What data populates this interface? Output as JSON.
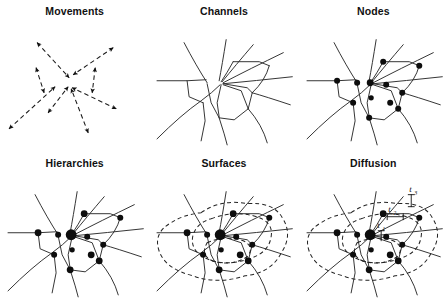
{
  "figure": {
    "layout": {
      "rows": 2,
      "columns": 3
    },
    "background_color": "#ffffff",
    "ink_color": "#1a1a1a"
  },
  "panels": [
    {
      "id": "movements",
      "title": "Movements",
      "row": 1,
      "column": 1,
      "content_type": "dashed double-headed arrows radiating from a common center",
      "arrow_count": 8,
      "line_style": "dashed",
      "arrowheads": "both ends"
    },
    {
      "id": "channels",
      "title": "Channels",
      "row": 1,
      "column": 2,
      "content_type": "network of solid lines / channel segments forming a planar graph",
      "line_style": "solid",
      "nodes_shown": false
    },
    {
      "id": "nodes",
      "title": "Nodes",
      "row": 1,
      "column": 3,
      "content_type": "same channel network with filled circular nodes at intersections",
      "line_style": "solid",
      "nodes_shown": true,
      "node_count": 12,
      "node_style": "uniform filled black dots"
    },
    {
      "id": "hierarchies",
      "title": "Hierarchies",
      "row": 2,
      "column": 1,
      "content_type": "node network with graduated node sizes indicating hierarchy",
      "line_style": "solid",
      "nodes_shown": true,
      "node_count": 12,
      "node_style": "graduated sizes, one enlarged central node"
    },
    {
      "id": "surfaces",
      "title": "Surfaces",
      "row": 2,
      "column": 2,
      "content_type": "node network overlaid with nested dashed closed contours (surfaces)",
      "line_style": "solid network plus dashed contours",
      "nodes_shown": true,
      "node_count": 12,
      "contour_count": 3
    },
    {
      "id": "diffusion",
      "title": "Diffusion",
      "row": 2,
      "column": 3,
      "content_type": "node network with dashed contours and labelled time steps of spread",
      "line_style": "solid network plus dashed contours",
      "nodes_shown": true,
      "node_count": 12,
      "contour_count": 3,
      "time_labels": [
        {
          "label": "t",
          "subscript": "1"
        },
        {
          "label": "t",
          "subscript": "2"
        },
        {
          "label": "t",
          "subscript": "3"
        }
      ]
    }
  ]
}
